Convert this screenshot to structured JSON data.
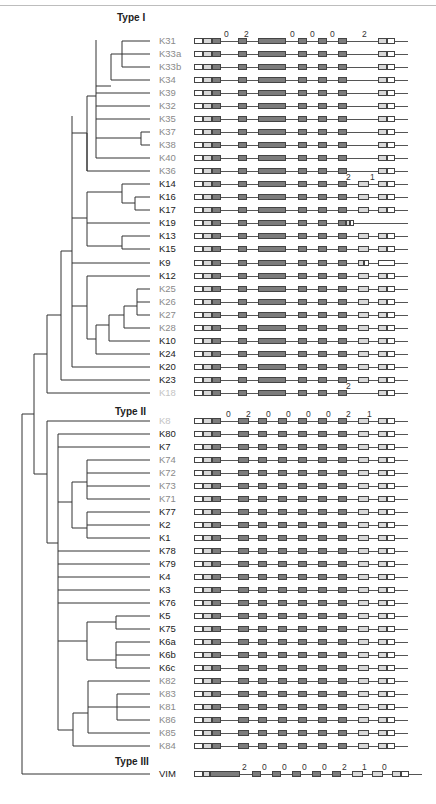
{
  "figure": {
    "groups": [
      {
        "title": "Type I",
        "title_pos": [
          117,
          18
        ]
      },
      {
        "title": "Type II",
        "title_pos": [
          115,
          412
        ]
      },
      {
        "title": "Type III",
        "title_pos": [
          115,
          762
        ]
      }
    ],
    "label_colors": {
      "black": "#222222",
      "gray": "#8a8a8a",
      "lightgray": "#c4c4c4"
    },
    "phase_labels": {
      "type1_header": [
        "0",
        "2",
        "0",
        "0",
        "0",
        "2"
      ],
      "K14": [
        "2",
        "1"
      ],
      "K18": [
        "2"
      ],
      "type2_header": [
        "0",
        "2",
        "0",
        "0",
        "0",
        "0",
        "2",
        "1"
      ],
      "type3_header": [
        "2",
        "0",
        "0",
        "0",
        "0",
        "2",
        "1",
        "0"
      ]
    },
    "rows": [
      {
        "id": "K31",
        "y": 41,
        "color": "gray",
        "pattern": "t1",
        "phases": "type1_header"
      },
      {
        "id": "K33a",
        "y": 54,
        "color": "gray",
        "pattern": "t1"
      },
      {
        "id": "K33b",
        "y": 67,
        "color": "gray",
        "pattern": "t1"
      },
      {
        "id": "K34",
        "y": 80,
        "color": "gray",
        "pattern": "t1"
      },
      {
        "id": "K39",
        "y": 93,
        "color": "gray",
        "pattern": "t1"
      },
      {
        "id": "K32",
        "y": 106,
        "color": "gray",
        "pattern": "t1"
      },
      {
        "id": "K35",
        "y": 119,
        "color": "gray",
        "pattern": "t1"
      },
      {
        "id": "K37",
        "y": 132,
        "color": "gray",
        "pattern": "t1"
      },
      {
        "id": "K38",
        "y": 145,
        "color": "gray",
        "pattern": "t1"
      },
      {
        "id": "K40",
        "y": 158,
        "color": "gray",
        "pattern": "t1"
      },
      {
        "id": "K36",
        "y": 171,
        "color": "gray",
        "pattern": "t1"
      },
      {
        "id": "K14",
        "y": 184,
        "color": "black",
        "pattern": "t1b",
        "phases": "K14"
      },
      {
        "id": "K16",
        "y": 197,
        "color": "black",
        "pattern": "t1b"
      },
      {
        "id": "K17",
        "y": 210,
        "color": "black",
        "pattern": "t1b"
      },
      {
        "id": "K19",
        "y": 223,
        "color": "black",
        "pattern": "k19"
      },
      {
        "id": "K13",
        "y": 236,
        "color": "black",
        "pattern": "t1b"
      },
      {
        "id": "K15",
        "y": 249,
        "color": "black",
        "pattern": "t1b"
      },
      {
        "id": "K9",
        "y": 263,
        "color": "black",
        "pattern": "k9"
      },
      {
        "id": "K12",
        "y": 276,
        "color": "black",
        "pattern": "t1b"
      },
      {
        "id": "K25",
        "y": 289,
        "color": "gray",
        "pattern": "t1b"
      },
      {
        "id": "K26",
        "y": 302,
        "color": "gray",
        "pattern": "t1b"
      },
      {
        "id": "K27",
        "y": 315,
        "color": "gray",
        "pattern": "t1b"
      },
      {
        "id": "K28",
        "y": 328,
        "color": "gray",
        "pattern": "t1b"
      },
      {
        "id": "K10",
        "y": 341,
        "color": "black",
        "pattern": "t1b"
      },
      {
        "id": "K24",
        "y": 354,
        "color": "black",
        "pattern": "t1b"
      },
      {
        "id": "K20",
        "y": 367,
        "color": "black",
        "pattern": "t1b"
      },
      {
        "id": "K23",
        "y": 380,
        "color": "black",
        "pattern": "t1b"
      },
      {
        "id": "K18",
        "y": 393,
        "color": "lightgray",
        "pattern": "t1",
        "phases": "K18"
      },
      {
        "id": "K8",
        "y": 421,
        "color": "lightgray",
        "pattern": "t2",
        "phases": "type2_header"
      },
      {
        "id": "K80",
        "y": 434,
        "color": "black",
        "pattern": "t2"
      },
      {
        "id": "K7",
        "y": 447,
        "color": "black",
        "pattern": "t2"
      },
      {
        "id": "K74",
        "y": 460,
        "color": "gray",
        "pattern": "t2"
      },
      {
        "id": "K72",
        "y": 473,
        "color": "gray",
        "pattern": "t2"
      },
      {
        "id": "K73",
        "y": 486,
        "color": "gray",
        "pattern": "t2"
      },
      {
        "id": "K71",
        "y": 499,
        "color": "gray",
        "pattern": "t2"
      },
      {
        "id": "K77",
        "y": 512,
        "color": "black",
        "pattern": "t2"
      },
      {
        "id": "K2",
        "y": 525,
        "color": "black",
        "pattern": "t2"
      },
      {
        "id": "K1",
        "y": 538,
        "color": "black",
        "pattern": "t2"
      },
      {
        "id": "K78",
        "y": 551,
        "color": "black",
        "pattern": "t2"
      },
      {
        "id": "K79",
        "y": 564,
        "color": "black",
        "pattern": "t2"
      },
      {
        "id": "K4",
        "y": 577,
        "color": "black",
        "pattern": "t2"
      },
      {
        "id": "K3",
        "y": 590,
        "color": "black",
        "pattern": "t2"
      },
      {
        "id": "K76",
        "y": 603,
        "color": "black",
        "pattern": "t2"
      },
      {
        "id": "K5",
        "y": 616,
        "color": "black",
        "pattern": "t2"
      },
      {
        "id": "K75",
        "y": 629,
        "color": "black",
        "pattern": "t2"
      },
      {
        "id": "K6a",
        "y": 642,
        "color": "black",
        "pattern": "t2"
      },
      {
        "id": "K6b",
        "y": 655,
        "color": "black",
        "pattern": "t2"
      },
      {
        "id": "K6c",
        "y": 668,
        "color": "black",
        "pattern": "t2"
      },
      {
        "id": "K82",
        "y": 681,
        "color": "gray",
        "pattern": "t2"
      },
      {
        "id": "K83",
        "y": 694,
        "color": "gray",
        "pattern": "t2"
      },
      {
        "id": "K81",
        "y": 707,
        "color": "gray",
        "pattern": "t2"
      },
      {
        "id": "K86",
        "y": 720,
        "color": "gray",
        "pattern": "t2"
      },
      {
        "id": "K85",
        "y": 733,
        "color": "gray",
        "pattern": "t2"
      },
      {
        "id": "K84",
        "y": 746,
        "color": "gray",
        "pattern": "t2"
      },
      {
        "id": "VIM",
        "y": 774,
        "color": "black",
        "pattern": "t3",
        "phases": "type3_header"
      }
    ]
  }
}
